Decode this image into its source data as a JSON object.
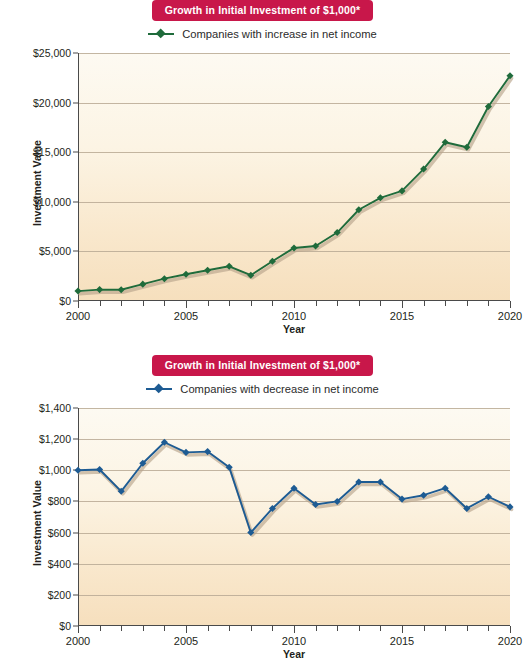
{
  "charts": [
    {
      "id": "increase",
      "title": "Growth in Initial Investment of $1,000*",
      "legend_label": "Companies with increase in net income",
      "series_color": "#1f6b3b",
      "badge_color": "#c8174a",
      "xlabel": "Year",
      "ylabel": "Investment Value",
      "ytick_labels": [
        "$0",
        "$5,000",
        "$10,000",
        "$15,000",
        "$20,000",
        "$25,000"
      ],
      "xtick_labels": [
        "2000",
        "2005",
        "2010",
        "2015",
        "2020"
      ],
      "chart_data": {
        "type": "line",
        "title": "Growth in Initial Investment of $1,000*",
        "xlabel": "Year",
        "ylabel": "Investment Value",
        "xlim": [
          2000,
          2020
        ],
        "ylim": [
          0,
          25000
        ],
        "ytick_values": [
          0,
          5000,
          10000,
          15000,
          20000,
          25000
        ],
        "xtick_values": [
          2000,
          2005,
          2010,
          2015,
          2020
        ],
        "grid": true,
        "legend_position": "top-center",
        "x": [
          2000,
          2001,
          2002,
          2003,
          2004,
          2005,
          2006,
          2007,
          2008,
          2009,
          2010,
          2011,
          2012,
          2013,
          2014,
          2015,
          2016,
          2017,
          2018,
          2019,
          2020
        ],
        "series": [
          {
            "name": "Companies with increase in net income",
            "color": "#1f6b3b",
            "values": [
              1000,
              1150,
              1130,
              1700,
              2250,
              2700,
              3100,
              3500,
              2600,
              4000,
              5350,
              5550,
              6900,
              9200,
              10400,
              11100,
              13300,
              16000,
              15500,
              19600,
              22700
            ]
          }
        ]
      }
    },
    {
      "id": "decrease",
      "title": "Growth in Initial Investment of $1,000*",
      "legend_label": "Companies with decrease in net income",
      "series_color": "#1d5b93",
      "badge_color": "#c8174a",
      "xlabel": "Year",
      "ylabel": "Investment Value",
      "ytick_labels": [
        "$0",
        "$200",
        "$400",
        "$600",
        "$800",
        "$1,000",
        "$1,200",
        "$1,400"
      ],
      "xtick_labels": [
        "2000",
        "2005",
        "2010",
        "2015",
        "2020"
      ],
      "chart_data": {
        "type": "line",
        "title": "Growth in Initial Investment of $1,000*",
        "xlabel": "Year",
        "ylabel": "Investment Value",
        "xlim": [
          2000,
          2020
        ],
        "ylim": [
          0,
          1400
        ],
        "ytick_values": [
          0,
          200,
          400,
          600,
          800,
          1000,
          1200,
          1400
        ],
        "xtick_values": [
          2000,
          2005,
          2010,
          2015,
          2020
        ],
        "grid": true,
        "legend_position": "top-center",
        "x": [
          2000,
          2001,
          2002,
          2003,
          2004,
          2005,
          2006,
          2007,
          2008,
          2009,
          2010,
          2011,
          2012,
          2013,
          2014,
          2015,
          2016,
          2017,
          2018,
          2019,
          2020
        ],
        "series": [
          {
            "name": "Companies with decrease in net income",
            "color": "#1d5b93",
            "values": [
              1000,
              1005,
              865,
              1045,
              1180,
              1115,
              1120,
              1020,
              600,
              755,
              885,
              780,
              800,
              925,
              925,
              815,
              840,
              885,
              755,
              830,
              765
            ]
          }
        ]
      }
    }
  ]
}
